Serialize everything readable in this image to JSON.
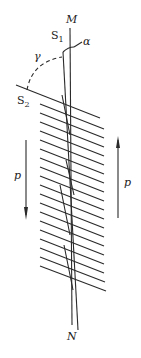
{
  "diagram": {
    "labels": {
      "M": "M",
      "N": "N",
      "S1": "S",
      "S1_sub": "1",
      "S2": "S",
      "S2_sub": "2",
      "alpha": "α",
      "gamma": "γ",
      "p_left": "p",
      "p_right": "p"
    },
    "stroke_color": "#2a2a2a"
  }
}
